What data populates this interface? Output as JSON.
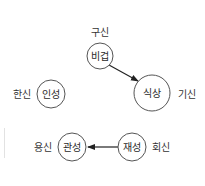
{
  "diagram": {
    "nodes": [
      {
        "id": "bigeop",
        "label": "비겁",
        "role": "구신",
        "cx": 100,
        "cy": 56,
        "r": 13,
        "role_x": 100,
        "role_y": 32
      },
      {
        "id": "siksang",
        "label": "식상",
        "role": "기신",
        "cx": 152,
        "cy": 93,
        "r": 18,
        "role_x": 187,
        "role_y": 94
      },
      {
        "id": "inseong",
        "label": "인성",
        "role": "한신",
        "cx": 51,
        "cy": 94,
        "r": 14,
        "role_x": 22,
        "role_y": 94
      },
      {
        "id": "gwanseong",
        "label": "관성",
        "role": "용신",
        "cx": 72,
        "cy": 147,
        "r": 14,
        "role_x": 43,
        "role_y": 147
      },
      {
        "id": "jaeseong",
        "label": "재성",
        "role": "회신",
        "cx": 132,
        "cy": 147,
        "r": 14,
        "role_x": 161,
        "role_y": 147
      }
    ],
    "edges": [
      {
        "from": "bigeop",
        "to": "siksang"
      },
      {
        "from": "jaeseong",
        "to": "gwanseong"
      }
    ],
    "colors": {
      "stroke": "#555555",
      "arrow": "#222222",
      "text": "#2a2a2a"
    }
  }
}
